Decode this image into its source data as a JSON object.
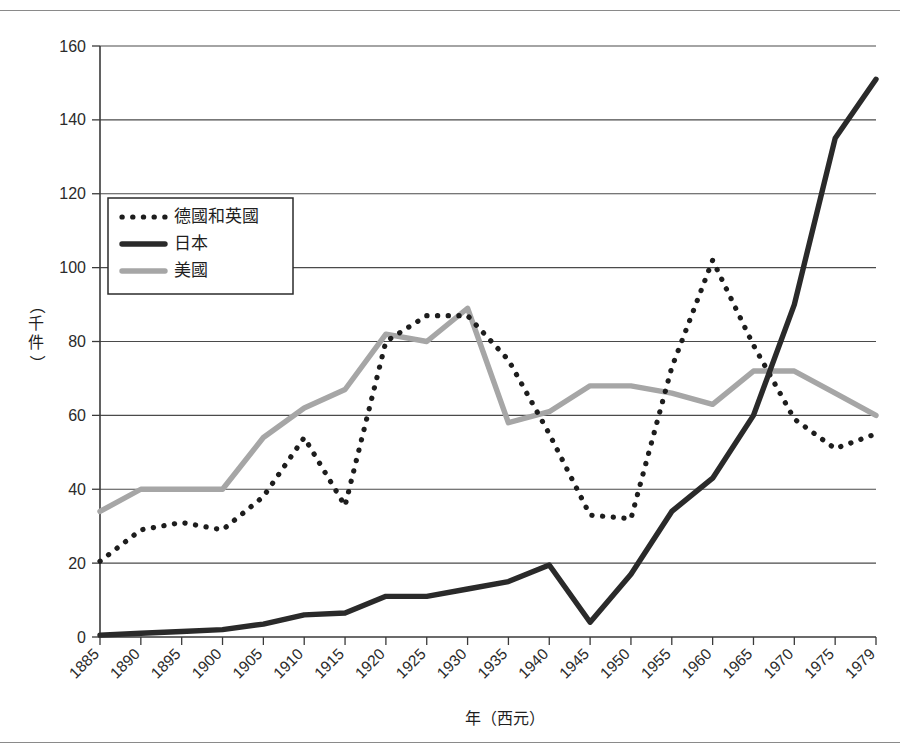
{
  "page": {
    "title_top_rule": "",
    "background": "#ffffff"
  },
  "chart_data": {
    "type": "line",
    "title": "",
    "xlabel": "年（西元）",
    "ylabel": "（千件）",
    "xlim": [
      1885,
      1979
    ],
    "ylim": [
      0,
      160
    ],
    "ytick_step": 20,
    "grid": true,
    "legend_position": "upper-left-inside",
    "categories": [
      1885,
      1890,
      1895,
      1900,
      1905,
      1910,
      1915,
      1920,
      1925,
      1930,
      1935,
      1940,
      1945,
      1950,
      1955,
      1960,
      1965,
      1970,
      1975,
      1979
    ],
    "xtick_labels": [
      "1885",
      "1890",
      "1895",
      "1900",
      "1905",
      "1910",
      "1915",
      "1920",
      "1925",
      "1930",
      "1935",
      "1940",
      "1945",
      "1950",
      "1955",
      "1960",
      "1965",
      "1970",
      "1975",
      "1979"
    ],
    "ytick_labels": [
      "0",
      "20",
      "40",
      "60",
      "80",
      "100",
      "120",
      "140",
      "160"
    ],
    "ytick_values": [
      0,
      20,
      40,
      60,
      80,
      100,
      120,
      140,
      160
    ],
    "series": [
      {
        "name": "德國和英國",
        "style": "dotted",
        "color": "#1d1d1d",
        "values": [
          20.5,
          29,
          31,
          29,
          38,
          54,
          35.5,
          80,
          87,
          87,
          75,
          55,
          33,
          32,
          73,
          102,
          79,
          59,
          51,
          55
        ]
      },
      {
        "name": "日本",
        "style": "solid-thick",
        "color": "#2a2a2a",
        "values": [
          0.5,
          1,
          1.5,
          2,
          3.5,
          6,
          6.5,
          11,
          11,
          13,
          15,
          19.5,
          4,
          17,
          34,
          43,
          60,
          90,
          135,
          151
        ]
      },
      {
        "name": "美國",
        "style": "solid-gray",
        "color": "#a6a6a6",
        "values": [
          34,
          40,
          40,
          40,
          54,
          62,
          67,
          82,
          80,
          89,
          58,
          61,
          68,
          68,
          66,
          63,
          72,
          72,
          66,
          60
        ]
      }
    ]
  },
  "legend": {
    "entries": [
      {
        "label": "德國和英國",
        "marker": "dotted-line"
      },
      {
        "label": "日本",
        "marker": "solid-dark-line"
      },
      {
        "label": "美國",
        "marker": "solid-gray-line"
      }
    ]
  }
}
